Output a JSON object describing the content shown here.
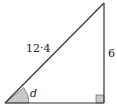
{
  "diagram": {
    "type": "right-triangle",
    "labels": {
      "hypotenuse": "12·4",
      "opposite_side": "6",
      "angle": "d"
    },
    "vertices": {
      "left": [
        5,
        103
      ],
      "right_angle": [
        104,
        103
      ],
      "top": [
        104,
        3
      ]
    },
    "colors": {
      "stroke": "#333333",
      "angle_fill": "#c8c8c8",
      "right_angle_fill": "#c8c8c8",
      "text": "#222222"
    }
  }
}
